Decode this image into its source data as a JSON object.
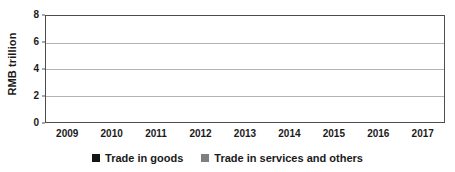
{
  "chart_data": {
    "type": "bar",
    "stacked": true,
    "title": "",
    "xlabel": "",
    "ylabel": "RMB trillion",
    "ylim": [
      0,
      8
    ],
    "yticks": [
      0,
      2,
      4,
      6,
      8
    ],
    "ytick_labels": [
      "0",
      "2",
      "4",
      "6",
      "8"
    ],
    "grid": true,
    "grid_axis": "y",
    "legend_position": "bottom-center",
    "categories": [
      "2009",
      "2010",
      "2011",
      "2012",
      "2013",
      "2014",
      "2015",
      "2016",
      "2017"
    ],
    "series": [
      {
        "name": "Trade in goods",
        "color": "#151515",
        "values": [
          0,
          0.3,
          1.45,
          2.65,
          4.2,
          5.95,
          6.45,
          4.2,
          3.3
        ]
      },
      {
        "name": "Trade in services and others",
        "color": "#7f7f7f",
        "values": [
          0,
          0.05,
          0.15,
          0.25,
          0.45,
          0.65,
          0.85,
          1.1,
          1.1
        ]
      }
    ],
    "totals": [
      0,
      0.35,
      1.6,
      2.9,
      4.65,
      6.6,
      7.3,
      5.3,
      4.4
    ]
  },
  "axis": {
    "y_title": "RMB trillion",
    "y_tick_labels": [
      "8",
      "6",
      "4",
      "2",
      "0"
    ],
    "x_tick_labels": [
      "2009",
      "2010",
      "2011",
      "2012",
      "2013",
      "2014",
      "2015",
      "2016",
      "2017"
    ]
  },
  "legend": {
    "items": [
      {
        "label": "Trade in goods",
        "color": "#151515",
        "swatch": "filled-square-icon"
      },
      {
        "label": "Trade in services and others",
        "color": "#7f7f7f",
        "swatch": "filled-square-icon"
      }
    ]
  },
  "colors": {
    "goods": "#151515",
    "services": "#7f7f7f",
    "gridline": "#b3b3b3",
    "axis": "#4d4d4d",
    "text": "#1a1a1a",
    "background": "#ffffff"
  }
}
